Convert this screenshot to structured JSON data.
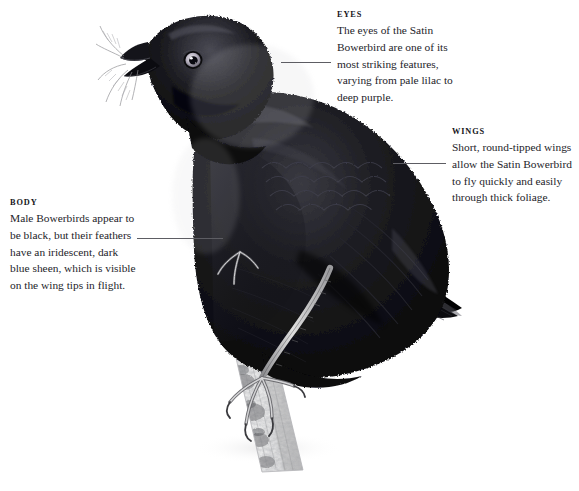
{
  "plate": {
    "subject": "Satin Bowerbird",
    "illustration_name": "satin-bowerbird-perched-on-branch",
    "background_color": "#ffffff",
    "ink_color": "#111114",
    "leader_line_color": "#5d5d63"
  },
  "callouts": [
    {
      "id": "eyes",
      "heading": "EYES",
      "body": "The eyes of the Satin\nBowerbird are one of its\nmost striking features,\nvarying from pale lilac to\ndeep purple.",
      "leader": {
        "x": 281,
        "y": 62,
        "length": 50
      }
    },
    {
      "id": "wings",
      "heading": "WINGS",
      "body": "Short, round-tipped wings\nallow the Satin Bowerbird\nto fly quickly and easily\nthrough thick foliage.",
      "leader": {
        "x": 393,
        "y": 163,
        "length": 53
      }
    },
    {
      "id": "body",
      "heading": "BODY",
      "body": "Male Bowerbirds appear to\nbe black, but their feathers\nhave an iridescent, dark\nblue sheen, which is visible\non the wing tips in flight.",
      "leader": {
        "x": 137,
        "y": 238,
        "length": 86
      }
    }
  ]
}
